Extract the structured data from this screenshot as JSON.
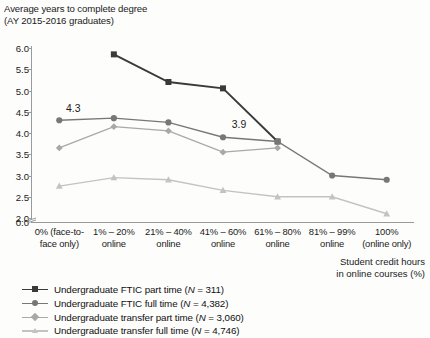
{
  "axis_title": "Average years to complete degree\n(AY 2015-2016 graduates)",
  "x_axis_caption": "Student credit hours\nin online courses (%)",
  "y_ticks": [
    "6.0",
    "5.5",
    "5.0",
    "4.5",
    "4.0",
    "3.5",
    "3.0",
    "2.5",
    "2.0",
    "0.0"
  ],
  "x_ticks": [
    "0% (face-to-\nface only)",
    "1% – 20%\nonline",
    "21% – 40%\nonline",
    "41% – 60%\nonline",
    "61% – 80%\nonline",
    "81% – 99%\nonline",
    "100%\n(online only)"
  ],
  "annotations": [
    {
      "text": "4.3",
      "x": 0,
      "y": 4.3,
      "dx": 14,
      "dy": -12
    },
    {
      "text": "3.9",
      "x": 3,
      "y": 3.9,
      "dx": 16,
      "dy": -13
    }
  ],
  "legend": [
    {
      "label": "Undergraduate FTIC part time (N = 311)",
      "marker": "square",
      "color": "#3a3a3a"
    },
    {
      "label": "Undergraduate FTIC full time (N = 4,382)",
      "marker": "circle",
      "color": "#777777"
    },
    {
      "label": "Undergraduate transfer part time (N = 3,060)",
      "marker": "diamond",
      "color": "#a8a8a8"
    },
    {
      "label": "Undergraduate transfer full time (N = 4,746)",
      "marker": "triangle",
      "color": "#c3c3c3"
    }
  ],
  "chart_data": {
    "type": "line",
    "title": "Average years to complete degree (AY 2015-2016 graduates)",
    "xlabel": "Student credit hours in online courses (%)",
    "ylabel": "Average years to complete degree",
    "grid": false,
    "legend_position": "bottom-left",
    "ylim": [
      2.0,
      6.0
    ],
    "y_axis_break": true,
    "y_ticks": [
      2.0,
      2.5,
      3.0,
      3.5,
      4.0,
      4.5,
      5.0,
      5.5,
      6.0
    ],
    "categories": [
      "0% (face-to-face only)",
      "1% – 20% online",
      "21% – 40% online",
      "41% – 60% online",
      "61% – 80% online",
      "81% – 99% online",
      "100% (online only)"
    ],
    "series": [
      {
        "name": "Undergraduate FTIC part time (N = 311)",
        "color": "#3a3a3a",
        "marker": "square",
        "values": [
          null,
          5.85,
          5.2,
          5.05,
          3.8,
          null,
          null
        ]
      },
      {
        "name": "Undergraduate FTIC full time (N = 4,382)",
        "color": "#777777",
        "marker": "circle",
        "values": [
          4.3,
          4.35,
          4.25,
          3.9,
          3.8,
          3.0,
          2.9
        ]
      },
      {
        "name": "Undergraduate transfer part time (N = 3,060)",
        "color": "#a8a8a8",
        "marker": "diamond",
        "values": [
          3.65,
          4.15,
          4.05,
          3.55,
          3.65,
          null,
          null
        ]
      },
      {
        "name": "Undergraduate transfer full time (N = 4,746)",
        "color": "#c3c3c3",
        "marker": "triangle",
        "values": [
          2.75,
          2.95,
          2.9,
          2.65,
          2.5,
          2.5,
          2.1
        ]
      }
    ]
  }
}
